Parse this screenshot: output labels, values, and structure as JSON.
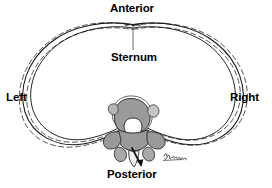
{
  "figure": {
    "background_color": "#ffffff",
    "labels": {
      "anterior": "Anterior",
      "sternum": "Sternum",
      "left": "Left",
      "right": "Right",
      "posterior": "Posterior"
    },
    "colors": {
      "outline": "#1a1a1a",
      "dashed_outline": "#555555",
      "bone_fill": "#9a9a9a",
      "bone_fill_light": "#c4c4c4",
      "bone_highlight": "#ffffff",
      "canal_fill": "#ffffff",
      "text": "#000000"
    },
    "structures": [
      {
        "name": "rib-cage-outline-solid",
        "style": "solid",
        "count": 2
      },
      {
        "name": "rib-cage-outline-dashed",
        "style": "dashed",
        "count": 2
      },
      {
        "name": "sternum-notch",
        "style": "solid"
      },
      {
        "name": "thoracic-vertebra",
        "style": "filled"
      },
      {
        "name": "vertebral-body",
        "style": "filled"
      },
      {
        "name": "vertebral-canal",
        "style": "white"
      },
      {
        "name": "transverse-process-left",
        "style": "filled"
      },
      {
        "name": "transverse-process-right",
        "style": "filled"
      },
      {
        "name": "spinous-process",
        "style": "filled"
      }
    ],
    "leader_lines": [
      {
        "name": "sternum-leader",
        "from": "Sternum label",
        "to": "sternum notch"
      },
      {
        "name": "posterior-arrow",
        "from": "spinous process",
        "to": "Posterior label"
      }
    ],
    "signature": "artist signature"
  }
}
